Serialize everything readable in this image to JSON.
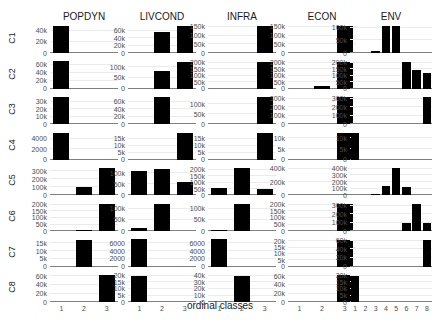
{
  "chart_data": {
    "type": "bar",
    "title": "",
    "xlabel": "ordinal classes",
    "ylabel": "",
    "grid": true,
    "legend": "none",
    "columns": [
      "POPDYN",
      "LIVCOND",
      "INFRA",
      "ECON",
      "ENV"
    ],
    "rows": [
      "C1",
      "C2",
      "C3",
      "C4",
      "C5",
      "C6",
      "C7",
      "C8"
    ],
    "x_categories": {
      "POPDYN": [
        "1",
        "2",
        "3"
      ],
      "LIVCOND": [
        "1",
        "2",
        "3"
      ],
      "INFRA": [
        "1",
        "2",
        "3"
      ],
      "ECON": [
        "1",
        "2",
        "3"
      ],
      "ENV": [
        "1",
        "2",
        "3",
        "4",
        "5",
        "6",
        "7",
        "8"
      ]
    },
    "panels": [
      {
        "row": "C1",
        "col": "POPDYN",
        "ymax": 50000,
        "yticks": [
          "0",
          "20k",
          "40k"
        ],
        "tickvals": [
          0,
          20000,
          40000
        ],
        "values": [
          48000,
          0,
          0
        ]
      },
      {
        "row": "C1",
        "col": "LIVCOND",
        "ymax": 75000,
        "yticks": [
          "0",
          "20k",
          "40k",
          "60k"
        ],
        "tickvals": [
          0,
          20000,
          40000,
          60000
        ],
        "values": [
          0,
          55000,
          72000
        ]
      },
      {
        "row": "C1",
        "col": "INFRA",
        "ymax": 160000,
        "yticks": [
          "0",
          "50k",
          "100k",
          "150k"
        ],
        "tickvals": [
          0,
          50000,
          100000,
          150000
        ],
        "values": [
          0,
          0,
          155000
        ]
      },
      {
        "row": "C1",
        "col": "ECON",
        "ymax": 160000,
        "yticks": [
          "0",
          "50k",
          "100k",
          "150k"
        ],
        "tickvals": [
          0,
          50000,
          100000,
          150000
        ],
        "values": [
          0,
          0,
          155000
        ]
      },
      {
        "row": "C1",
        "col": "ENV",
        "ymax": 110000,
        "yticks": [
          "0",
          "50k",
          "100k"
        ],
        "tickvals": [
          0,
          50000,
          100000
        ],
        "values": [
          0,
          0,
          8000,
          105000,
          105000,
          0,
          0,
          0
        ]
      },
      {
        "row": "C2",
        "col": "POPDYN",
        "ymax": 70000,
        "yticks": [
          "0",
          "20k",
          "40k",
          "60k"
        ],
        "tickvals": [
          0,
          20000,
          40000,
          60000
        ],
        "values": [
          68000,
          0,
          0
        ]
      },
      {
        "row": "C2",
        "col": "LIVCOND",
        "ymax": 130000,
        "yticks": [
          "0",
          "50k",
          "100k"
        ],
        "tickvals": [
          0,
          50000,
          100000
        ],
        "values": [
          0,
          80000,
          125000
        ]
      },
      {
        "row": "C2",
        "col": "INFRA",
        "ymax": 215000,
        "yticks": [
          "0",
          "50k",
          "100k",
          "150k",
          "200k"
        ],
        "tickvals": [
          0,
          50000,
          100000,
          150000,
          200000
        ],
        "values": [
          0,
          0,
          205000
        ]
      },
      {
        "row": "C2",
        "col": "ECON",
        "ymax": 215000,
        "yticks": [
          "0",
          "50k",
          "100k",
          "150k",
          "200k"
        ],
        "tickvals": [
          0,
          50000,
          100000,
          150000,
          200000
        ],
        "values": [
          0,
          20000,
          205000
        ]
      },
      {
        "row": "C2",
        "col": "ENV",
        "ymax": 215000,
        "yticks": [
          "0",
          "50k",
          "100k",
          "150k",
          "200k"
        ],
        "tickvals": [
          0,
          50000,
          100000,
          150000,
          200000
        ],
        "values": [
          0,
          0,
          0,
          0,
          0,
          205000,
          145000,
          120000
        ]
      },
      {
        "row": "C3",
        "col": "POPDYN",
        "ymax": 37000,
        "yticks": [
          "0",
          "10k",
          "20k",
          "30k"
        ],
        "tickvals": [
          0,
          10000,
          20000,
          30000
        ],
        "values": [
          36000,
          0,
          0
        ]
      },
      {
        "row": "C3",
        "col": "LIVCOND",
        "ymax": 75000,
        "yticks": [
          "0",
          "20k",
          "40k",
          "60k"
        ],
        "tickvals": [
          0,
          20000,
          40000,
          60000
        ],
        "values": [
          0,
          72000,
          0
        ]
      },
      {
        "row": "C3",
        "col": "INFRA",
        "ymax": 140000,
        "yticks": [
          "0",
          "50k",
          "100k"
        ],
        "tickvals": [
          0,
          50000,
          100000
        ],
        "values": [
          0,
          0,
          135000
        ]
      },
      {
        "row": "C3",
        "col": "ECON",
        "ymax": 330000,
        "yticks": [
          "0",
          "100k",
          "200k",
          "300k"
        ],
        "tickvals": [
          0,
          100000,
          200000,
          300000
        ],
        "values": [
          0,
          0,
          320000
        ]
      },
      {
        "row": "C3",
        "col": "ENV",
        "ymax": 330000,
        "yticks": [
          "0",
          "100k",
          "200k",
          "300k"
        ],
        "tickvals": [
          0,
          100000,
          200000,
          300000
        ],
        "values": [
          0,
          0,
          0,
          0,
          0,
          0,
          0,
          320000
        ]
      },
      {
        "row": "C4",
        "col": "POPDYN",
        "ymax": 5300,
        "yticks": [
          "0",
          "2000",
          "4000"
        ],
        "tickvals": [
          0,
          2000,
          4000
        ],
        "values": [
          5100,
          0,
          0
        ]
      },
      {
        "row": "C4",
        "col": "LIVCOND",
        "ymax": 20000,
        "yticks": [
          "0",
          "5k",
          "10k",
          "15k"
        ],
        "tickvals": [
          0,
          5000,
          10000,
          15000
        ],
        "values": [
          0,
          0,
          19500
        ]
      },
      {
        "row": "C4",
        "col": "INFRA",
        "ymax": 20000,
        "yticks": [
          "0",
          "5k",
          "10k",
          "15k"
        ],
        "tickvals": [
          0,
          5000,
          10000,
          15000
        ],
        "values": [
          0,
          0,
          19500
        ]
      },
      {
        "row": "C4",
        "col": "ECON",
        "ymax": 13000,
        "yticks": [
          "0",
          "5k",
          "10k"
        ],
        "tickvals": [
          0,
          5000,
          10000
        ],
        "values": [
          0,
          0,
          12500
        ]
      },
      {
        "row": "C4",
        "col": "ENV",
        "ymax": 13000,
        "yticks": [
          "0",
          "5k",
          "10k"
        ],
        "tickvals": [
          0,
          5000,
          10000
        ],
        "values": [
          12500,
          0,
          0,
          0,
          0,
          0,
          0,
          0
        ]
      },
      {
        "row": "C5",
        "col": "POPDYN",
        "ymax": 350000,
        "yticks": [
          "0",
          "100k",
          "200k",
          "300k"
        ],
        "tickvals": [
          0,
          100000,
          200000,
          300000
        ],
        "values": [
          0,
          110000,
          340000
        ]
      },
      {
        "row": "C5",
        "col": "LIVCOND",
        "ymax": 125000,
        "yticks": [
          "0",
          "50k",
          "100k"
        ],
        "tickvals": [
          0,
          50000,
          100000
        ],
        "values": [
          110000,
          120000,
          60000
        ]
      },
      {
        "row": "C5",
        "col": "INFRA",
        "ymax": 220000,
        "yticks": [
          "0",
          "50k",
          "100k",
          "150k",
          "200k"
        ],
        "tickvals": [
          0,
          50000,
          100000,
          150000,
          200000
        ],
        "values": [
          55000,
          215000,
          50000
        ]
      },
      {
        "row": "C5",
        "col": "ECON",
        "ymax": 420000,
        "yticks": [
          "0",
          "200k",
          "400k"
        ],
        "tickvals": [
          0,
          200000,
          400000
        ],
        "values": [
          0,
          0,
          0
        ]
      },
      {
        "row": "C5",
        "col": "ENV",
        "ymax": 420000,
        "yticks": [
          "0",
          "100k",
          "200k",
          "300k",
          "400k"
        ],
        "tickvals": [
          0,
          100000,
          200000,
          300000,
          400000
        ],
        "values": [
          0,
          0,
          20000,
          140000,
          410000,
          120000,
          0,
          0
        ]
      },
      {
        "row": "C6",
        "col": "POPDYN",
        "ymax": 215000,
        "yticks": [
          "0",
          "50k",
          "100k",
          "150k",
          "200k"
        ],
        "tickvals": [
          0,
          50000,
          100000,
          150000,
          200000
        ],
        "values": [
          0,
          10000,
          210000
        ]
      },
      {
        "row": "C6",
        "col": "LIVCOND",
        "ymax": 125000,
        "yticks": [
          "0",
          "50k",
          "100k"
        ],
        "tickvals": [
          0,
          50000,
          100000
        ],
        "values": [
          15000,
          120000,
          0
        ]
      },
      {
        "row": "C6",
        "col": "INFRA",
        "ymax": 125000,
        "yticks": [
          "0",
          "50k",
          "100k"
        ],
        "tickvals": [
          0,
          50000,
          100000
        ],
        "values": [
          5000,
          120000,
          0
        ]
      },
      {
        "row": "C6",
        "col": "ECON",
        "ymax": 215000,
        "yticks": [
          "0",
          "50k",
          "100k",
          "150k",
          "200k"
        ],
        "tickvals": [
          0,
          50000,
          100000,
          150000,
          200000
        ],
        "values": [
          0,
          0,
          210000
        ]
      },
      {
        "row": "C6",
        "col": "ENV",
        "ymax": 330000,
        "yticks": [
          "0",
          "100k",
          "200k",
          "300k"
        ],
        "tickvals": [
          0,
          100000,
          200000,
          300000
        ],
        "values": [
          0,
          0,
          0,
          0,
          0,
          100000,
          320000,
          100000
        ]
      },
      {
        "row": "C7",
        "col": "POPDYN",
        "ymax": 18000,
        "yticks": [
          "0",
          "5k",
          "10k",
          "15k"
        ],
        "tickvals": [
          0,
          5000,
          10000,
          15000
        ],
        "values": [
          0,
          17000,
          0
        ]
      },
      {
        "row": "C7",
        "col": "LIVCOND",
        "ymax": 7200,
        "yticks": [
          "0",
          "2000",
          "4000",
          "6000"
        ],
        "tickvals": [
          0,
          2000,
          4000,
          6000
        ],
        "values": [
          7000,
          0,
          0
        ]
      },
      {
        "row": "C7",
        "col": "INFRA",
        "ymax": 7200,
        "yticks": [
          "0",
          "2000",
          "4000",
          "6000"
        ],
        "tickvals": [
          0,
          2000,
          4000,
          6000
        ],
        "values": [
          7000,
          0,
          0
        ]
      },
      {
        "row": "C7",
        "col": "ECON",
        "ymax": 22000,
        "yticks": [
          "0",
          "5k",
          "10k",
          "15k",
          "20k"
        ],
        "tickvals": [
          0,
          5000,
          10000,
          15000,
          20000
        ],
        "values": [
          0,
          0,
          21000
        ]
      },
      {
        "row": "C7",
        "col": "ENV",
        "ymax": 65000,
        "yticks": [
          "0",
          "20k",
          "40k",
          "60k"
        ],
        "tickvals": [
          0,
          20000,
          40000,
          60000
        ],
        "values": [
          0,
          0,
          0,
          0,
          0,
          0,
          0,
          62000
        ]
      },
      {
        "row": "C8",
        "col": "POPDYN",
        "ymax": 65000,
        "yticks": [
          "0",
          "20k",
          "40k",
          "60k"
        ],
        "tickvals": [
          0,
          20000,
          40000,
          60000
        ],
        "values": [
          0,
          0,
          62000
        ]
      },
      {
        "row": "C8",
        "col": "LIVCOND",
        "ymax": 21000,
        "yticks": [
          "0",
          "5k",
          "10k",
          "15k",
          "20k"
        ],
        "tickvals": [
          0,
          5000,
          10000,
          15000,
          20000
        ],
        "values": [
          20000,
          0,
          0
        ]
      },
      {
        "row": "C8",
        "col": "INFRA",
        "ymax": 42000,
        "yticks": [
          "0",
          "10k",
          "20k",
          "30k",
          "40k"
        ],
        "tickvals": [
          0,
          10000,
          20000,
          30000,
          40000
        ],
        "values": [
          0,
          40000,
          0
        ]
      },
      {
        "row": "C8",
        "col": "ECON",
        "ymax": 65000,
        "yticks": [
          "0",
          "20k",
          "40k",
          "60k"
        ],
        "tickvals": [
          0,
          20000,
          40000,
          60000
        ],
        "values": [
          0,
          0,
          62000
        ]
      },
      {
        "row": "C8",
        "col": "ENV",
        "ymax": 21000,
        "yticks": [
          "0",
          "5k",
          "10k",
          "15k",
          "20k"
        ],
        "tickvals": [
          0,
          5000,
          10000,
          15000,
          20000
        ],
        "values": [
          20000,
          0,
          0,
          0,
          0,
          0,
          0,
          0
        ]
      }
    ]
  },
  "labels": {
    "xlabel": "ordinal classes"
  }
}
